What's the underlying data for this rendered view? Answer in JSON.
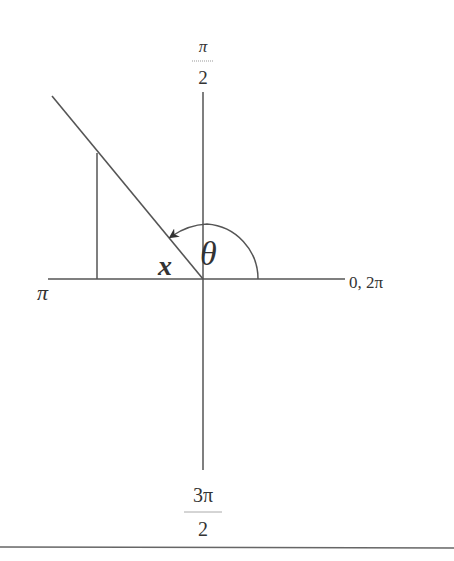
{
  "diagram": {
    "type": "unit-circle-angle",
    "colors": {
      "background": "#ffffff",
      "stroke": "#555555",
      "text": "#333333",
      "arrow": "#333333"
    },
    "axis_labels": {
      "top": {
        "numerator": "π",
        "denominator": "2"
      },
      "bottom": {
        "numerator": "3π",
        "denominator": "2"
      },
      "left": "π",
      "right": "0, 2π"
    },
    "angle_label": "θ",
    "reference_angle_label": "x"
  }
}
